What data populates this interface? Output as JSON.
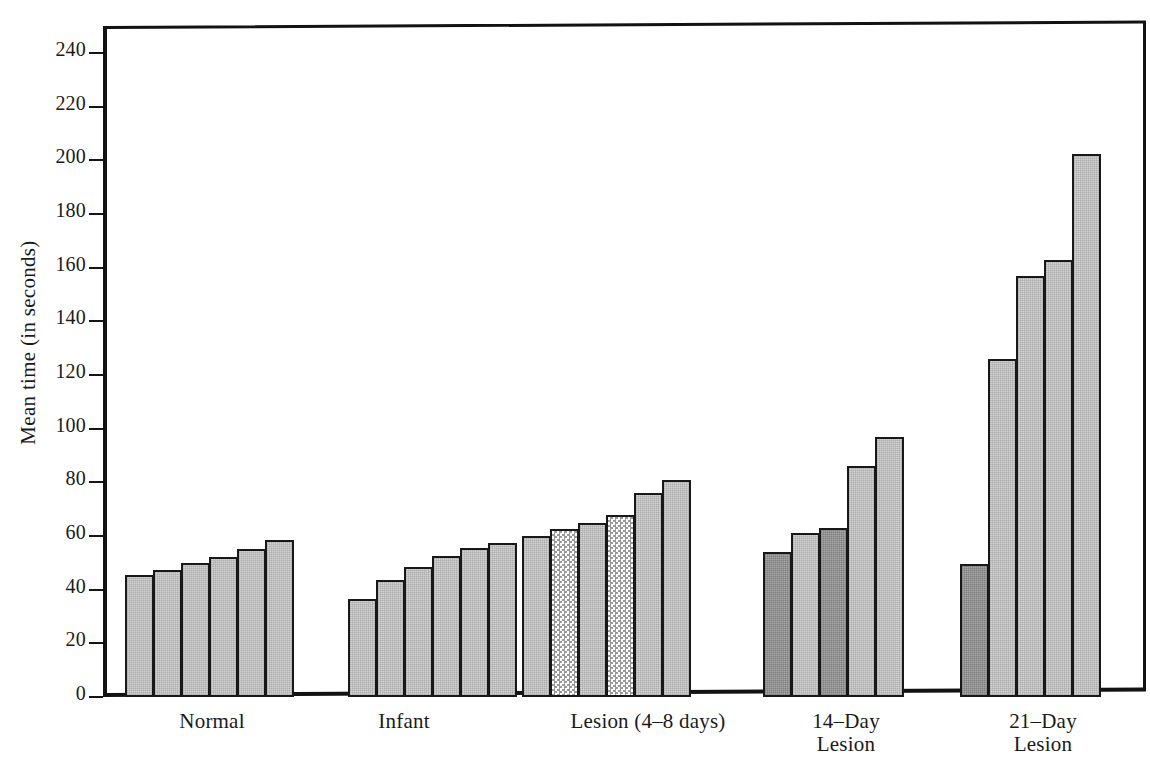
{
  "chart_data": {
    "type": "bar",
    "title": "",
    "subtitle": "",
    "xlabel": "",
    "ylabel": "Mean time (in seconds)",
    "ylim": [
      0,
      250
    ],
    "ytick_values": [
      0,
      20,
      40,
      60,
      80,
      100,
      120,
      140,
      160,
      180,
      200,
      220,
      240
    ],
    "ytick_labels": [
      "0",
      "20",
      "40",
      "60",
      "80",
      "100",
      "120",
      "140",
      "160",
      "180",
      "200",
      "220",
      "240"
    ],
    "grid": false,
    "legend": "none",
    "categories": [
      "Normal",
      "Infant",
      "Lesion (4–8 days)",
      "14–Day\nLesion",
      "21–Day\nLesion"
    ],
    "groups": [
      {
        "label": "Normal",
        "values": [
          45.5,
          47.5,
          50.0,
          52.0,
          55.0,
          58.5
        ],
        "patterns": [
          "light",
          "light",
          "light",
          "light",
          "light",
          "light"
        ]
      },
      {
        "label": "Infant",
        "values": [
          36.5,
          43.5,
          48.5,
          52.5,
          55.5,
          57.5
        ],
        "patterns": [
          "light",
          "light",
          "light",
          "light",
          "light",
          "light"
        ]
      },
      {
        "label": "Lesion (4–8 days)",
        "values": [
          60.0,
          62.5,
          65.0,
          68.0,
          76.0,
          81.0
        ],
        "patterns": [
          "light",
          "checker",
          "light",
          "checker",
          "light",
          "light"
        ]
      },
      {
        "label": "14–Day\nLesion",
        "values": [
          54.0,
          61.0,
          63.0,
          86.0,
          97.0
        ],
        "patterns": [
          "dark",
          "light",
          "dark",
          "light",
          "light"
        ]
      },
      {
        "label": "21–Day\nLesion",
        "values": [
          49.5,
          126.0,
          157.0,
          163.0,
          202.5
        ],
        "patterns": [
          "dark",
          "light",
          "light",
          "light",
          "light"
        ]
      }
    ],
    "values_flat": [
      45.5,
      47.5,
      50.0,
      52.0,
      55.0,
      58.5,
      36.5,
      43.5,
      48.5,
      52.5,
      55.5,
      57.5,
      60.0,
      62.5,
      65.0,
      68.0,
      76.0,
      81.0,
      54.0,
      61.0,
      63.0,
      86.0,
      97.0,
      49.5,
      126.0,
      157.0,
      163.0,
      202.5
    ],
    "colors": {
      "bar_light": "#d2d2d2",
      "bar_dark": "#a6a6a6",
      "bar_checker": "#e4e4e4",
      "outline": "#17181a",
      "background": "#ffffff"
    }
  },
  "layout": {
    "plot_left": 103,
    "plot_top": 26,
    "plot_width": 1043,
    "plot_height": 671,
    "bar_width": 29,
    "group_starts": [
      125,
      348,
      522,
      763,
      960
    ],
    "group_label_centers": [
      212,
      404,
      648,
      846,
      1043
    ],
    "group_label_top": 710
  }
}
